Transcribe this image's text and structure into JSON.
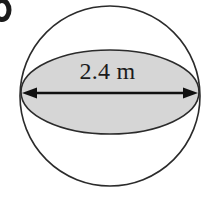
{
  "figure": {
    "kind": "sphere-cross-section-diagram",
    "item_label": "b",
    "background_color": "#ffffff",
    "outline_color": "#2b2b2b",
    "shade_color": "#d6d6d6",
    "text_color": "#1b1b1b",
    "sphere": {
      "name": "sphere-outline",
      "center_x": 110,
      "center_y": 96,
      "radius": 90,
      "stroke_width": 1.6,
      "fill": "none"
    },
    "cross_section": {
      "name": "great-circle-ellipse",
      "center_x": 110,
      "center_y": 92,
      "radius_x": 89,
      "radius_y": 42,
      "fill": "#d6d6d6",
      "stroke_width": 1.6
    },
    "dimension": {
      "name": "diameter-dimension",
      "label": "2.4 m",
      "value": 2.4,
      "unit": "m",
      "quantity": "diameter",
      "line_y": 93,
      "line_x_start": 23,
      "line_x_end": 197,
      "arrow_style": "double-headed",
      "stroke_width": 2.4
    }
  }
}
